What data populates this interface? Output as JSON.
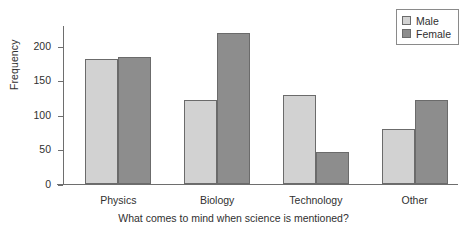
{
  "chart_data": {
    "type": "bar",
    "title": "",
    "subtitle": "",
    "categories": [
      "Physics",
      "Biology",
      "Technology",
      "Other"
    ],
    "series": [
      {
        "name": "Male",
        "color": "#d2d2d2",
        "values": [
          181,
          122,
          129,
          79
        ]
      },
      {
        "name": "Female",
        "color": "#8d8d8d",
        "values": [
          184,
          218,
          47,
          122
        ]
      }
    ],
    "xlabel": "What comes to mind when science is mentioned?",
    "ylabel": "Frequency",
    "ylim": [
      0,
      230
    ],
    "yticks": [
      0,
      50,
      100,
      150,
      200
    ],
    "ytick_labels": [
      "0",
      "50",
      "100",
      "150",
      "200"
    ],
    "grid": false,
    "legend_position": "top-right",
    "legend_entries": [
      "Male",
      "Female"
    ],
    "annotations": []
  },
  "axes": {
    "y_title": "Frequency",
    "x_title": "What comes to mind when science is mentioned?"
  },
  "legend": {
    "items": [
      {
        "label": "Male",
        "color": "#d2d2d2"
      },
      {
        "label": "Female",
        "color": "#8d8d8d"
      }
    ]
  },
  "colors": {
    "male": "#d2d2d2",
    "female": "#8d8d8d",
    "axis": "#6e6e6e",
    "text": "#303030",
    "background": "#ffffff"
  }
}
